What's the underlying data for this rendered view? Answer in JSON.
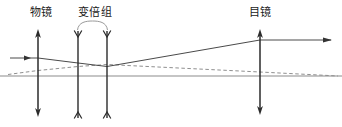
{
  "diagram": {
    "kind": "optical-ray-diagram",
    "width": 342,
    "height": 127,
    "background_color": "#ffffff",
    "ink_color": "#1a1a1a",
    "ray_color": "#4a4a4a",
    "axis_color": "#808080",
    "dashed_ray_color": "#8a8a8a"
  },
  "labels": [
    {
      "id": "objective",
      "text": "物镜",
      "x": 41,
      "y": 13
    },
    {
      "id": "zoom-group",
      "text": "变倍组",
      "x": 95,
      "y": 13
    },
    {
      "id": "eyepiece",
      "text": "目镜",
      "x": 260,
      "y": 13
    }
  ],
  "elements": {
    "objective_lens": {
      "name": "物镜",
      "type": "converging-lens",
      "x": 38,
      "y_top": 30,
      "y_bottom": 116,
      "arrow_ends": "outward"
    },
    "zoom_lens_front": {
      "name": "变倍组前片",
      "type": "diverging-lens",
      "x": 78,
      "y_top": 31,
      "y_bottom": 118,
      "arrow_ends": "inward"
    },
    "zoom_lens_rear": {
      "name": "变倍组后片",
      "type": "diverging-lens",
      "x": 107,
      "y_top": 31,
      "y_bottom": 118,
      "arrow_ends": "inward"
    },
    "eyepiece_lens": {
      "name": "目镜",
      "type": "converging-lens",
      "x": 260,
      "y_top": 30,
      "y_bottom": 114,
      "arrow_ends": "outward"
    },
    "zoom_group_brace": {
      "name": "变倍组括号",
      "x_left": 78,
      "x_right": 107,
      "y": 27
    },
    "optical_axis": {
      "name": "光轴",
      "y": 76,
      "x_start": 0,
      "x_end": 342
    }
  },
  "rays": {
    "solid_marginal": {
      "name": "实线光线",
      "style": "solid",
      "points": [
        [
          10,
          58
        ],
        [
          38,
          58
        ],
        [
          78,
          63
        ],
        [
          107,
          66
        ],
        [
          260,
          40
        ],
        [
          330,
          40
        ]
      ],
      "arrowheads": [
        {
          "at": [
            30,
            58
          ],
          "direction": "right"
        },
        {
          "at": [
            330,
            40
          ],
          "direction": "right"
        }
      ]
    },
    "dashed_chief": {
      "name": "虚线光线",
      "style": "dashed",
      "points": [
        [
          10,
          74
        ],
        [
          38,
          70
        ],
        [
          78,
          66
        ],
        [
          107,
          64
        ],
        [
          260,
          72
        ],
        [
          335,
          76
        ]
      ]
    }
  }
}
